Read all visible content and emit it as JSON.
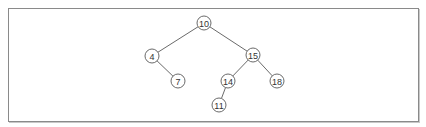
{
  "diagram": {
    "type": "binary-search-tree",
    "colors": {
      "frame_border": "#8a8a8a",
      "edge": "#6a6a6a",
      "node_stroke": "#6a6a6a",
      "node_fill": "#ffffff",
      "label": "#333333"
    },
    "node_radius": 7,
    "nodes": [
      {
        "id": "n10",
        "label": "10",
        "x": 204,
        "y": 23
      },
      {
        "id": "n4",
        "label": "4",
        "x": 152,
        "y": 56
      },
      {
        "id": "n7",
        "label": "7",
        "x": 178,
        "y": 81
      },
      {
        "id": "n15",
        "label": "15",
        "x": 253,
        "y": 55
      },
      {
        "id": "n14",
        "label": "14",
        "x": 228,
        "y": 81
      },
      {
        "id": "n18",
        "label": "18",
        "x": 277,
        "y": 81
      },
      {
        "id": "n11",
        "label": "11",
        "x": 219,
        "y": 105
      }
    ],
    "edges": [
      {
        "from": "n10",
        "to": "n4"
      },
      {
        "from": "n10",
        "to": "n15"
      },
      {
        "from": "n4",
        "to": "n7"
      },
      {
        "from": "n15",
        "to": "n14"
      },
      {
        "from": "n15",
        "to": "n18"
      },
      {
        "from": "n14",
        "to": "n11"
      }
    ]
  }
}
